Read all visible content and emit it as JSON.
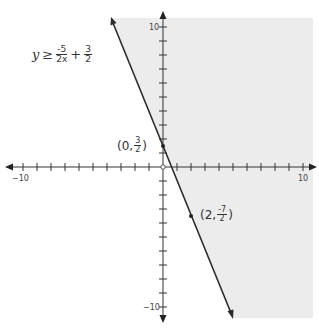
{
  "chart_data": {
    "type": "line",
    "title": "",
    "inequality": {
      "lhs": "y",
      "symbol": "≥",
      "term1": {
        "numerator": "-5",
        "denominator": "2x"
      },
      "operator": "+",
      "term2": {
        "numerator": "3",
        "denominator": "2"
      }
    },
    "boundary_line": {
      "slope": -2.5,
      "intercept": 1.5,
      "style": "solid",
      "arrows": "both"
    },
    "shaded_region": "right of line (y >= -5/2 x + 3/2)",
    "points": [
      {
        "x": 0,
        "y": 1.5,
        "label_prefix": "(0,",
        "label_num": "3",
        "label_den": "2",
        "label_suffix": ")"
      },
      {
        "x": 2,
        "y": -3.5,
        "label_prefix": "(2,",
        "label_num": "-7",
        "label_den": "2",
        "label_suffix": ")"
      }
    ],
    "xlim": [
      -10,
      10
    ],
    "ylim": [
      -10,
      10
    ],
    "x_tick_labels": {
      "min": "−10",
      "max": "10"
    },
    "y_tick_labels": {
      "min": "−10",
      "max": "10"
    },
    "tick_step": 1,
    "grid": false,
    "colors": {
      "shade": "#ececec",
      "line": "#2b2b2b",
      "axis": "#333333"
    }
  }
}
